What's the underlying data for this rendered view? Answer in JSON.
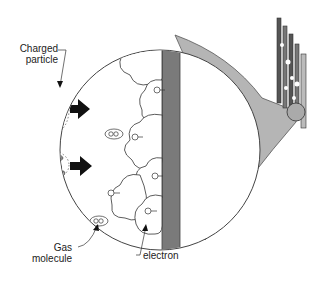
{
  "diagram": {
    "labels": {
      "charged_particle_line1": "Charged",
      "charged_particle_line2": "particle",
      "gas_molecule_line1": "Gas",
      "gas_molecule_line2": "molecule",
      "electron": "electron"
    },
    "colors": {
      "wall": "#7a7a7a",
      "cone": "#b5b5b5",
      "outline": "#333333",
      "arrow": "#111111"
    }
  }
}
